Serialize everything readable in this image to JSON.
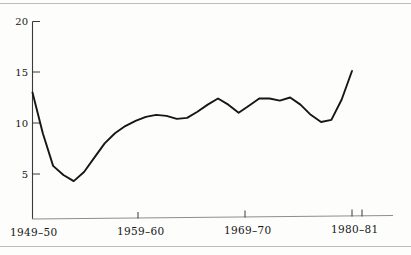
{
  "figure": {
    "background_color": "#fdfdfc",
    "line_color": "#161616",
    "axis_color": "#3a3a3a",
    "rule_color": "#bdbdbd"
  },
  "chart_data": {
    "type": "line",
    "title": "",
    "subtitle": "",
    "xlabel": "",
    "ylabel": "",
    "grid": false,
    "legend": "none",
    "ylim": [
      0,
      20
    ],
    "y_ticks": [
      5,
      10,
      15,
      20
    ],
    "y_tick_labels": [
      "5",
      "10",
      "15",
      "20"
    ],
    "x_tick_labels": [
      "1949–50",
      "1959–60",
      "1969–70",
      "1980–81"
    ],
    "x_tick_years": [
      "1949-50",
      "1959-60",
      "1969-70",
      "1980-81"
    ],
    "xlim": [
      "1949-50",
      "1981-82"
    ],
    "categories": [
      "1949-50",
      "1950-51",
      "1951-52",
      "1952-53",
      "1953-54",
      "1954-55",
      "1955-56",
      "1956-57",
      "1957-58",
      "1958-59",
      "1959-60",
      "1960-61",
      "1961-62",
      "1962-63",
      "1963-64",
      "1964-65",
      "1965-66",
      "1966-67",
      "1967-68",
      "1968-69",
      "1969-70",
      "1970-71",
      "1971-72",
      "1972-73",
      "1973-74",
      "1974-75",
      "1975-76",
      "1976-77",
      "1977-78",
      "1978-79",
      "1979-80",
      "1980-81"
    ],
    "values": [
      13.0,
      9.0,
      5.8,
      4.9,
      4.3,
      5.2,
      6.6,
      8.0,
      9.0,
      9.7,
      10.2,
      10.6,
      10.8,
      10.7,
      10.4,
      10.5,
      11.1,
      11.8,
      12.4,
      11.8,
      11.0,
      11.7,
      12.4,
      12.4,
      12.2,
      12.5,
      11.8,
      10.8,
      10.1,
      10.3,
      12.3,
      15.1
    ]
  }
}
